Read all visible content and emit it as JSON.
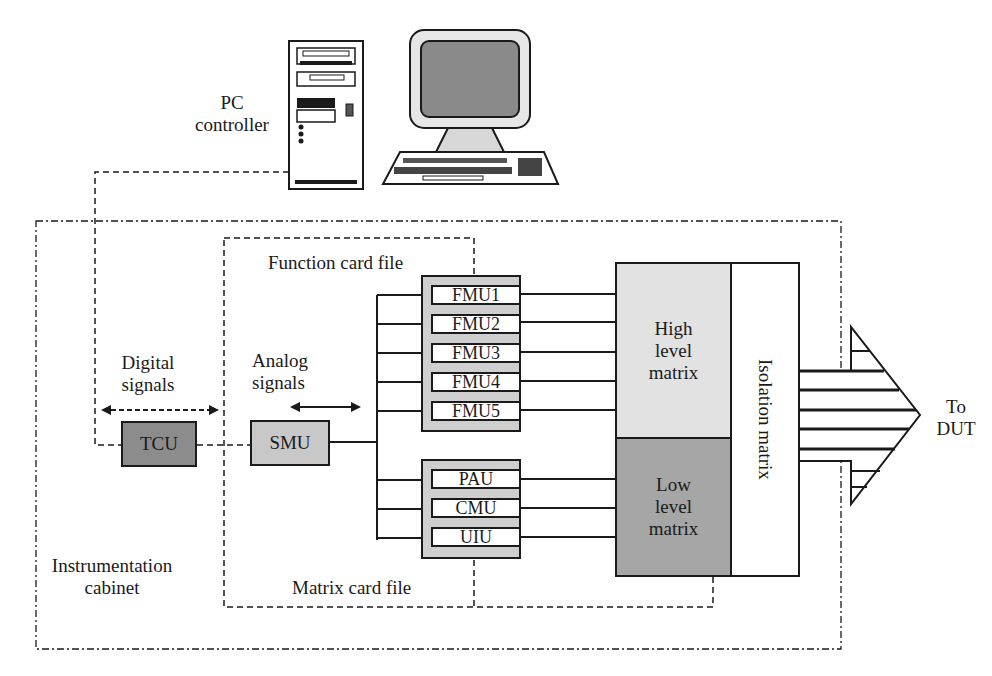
{
  "diagram": {
    "pc": {
      "label_line1": "PC",
      "label_line2": "controller"
    },
    "cabinet": {
      "label_line1": "Instrumentation",
      "label_line2": "cabinet"
    },
    "function_card_file": {
      "label": "Function card file",
      "units": [
        "FMU1",
        "FMU2",
        "FMU3",
        "FMU4",
        "FMU5"
      ]
    },
    "matrix_card_file": {
      "label": "Matrix card file",
      "units": [
        "PAU",
        "CMU",
        "UIU"
      ]
    },
    "tcu": {
      "label": "TCU"
    },
    "smu": {
      "label": "SMU"
    },
    "digital_signals": {
      "line1": "Digital",
      "line2": "signals"
    },
    "analog_signals": {
      "line1": "Analog",
      "line2": "signals"
    },
    "high_level_matrix": {
      "line1": "High",
      "line2": "level",
      "line3": "matrix"
    },
    "low_level_matrix": {
      "line1": "Low",
      "line2": "level",
      "line3": "matrix"
    },
    "isolation_matrix": {
      "label": "Isolation matrix"
    },
    "output": {
      "line1": "To",
      "line2": "DUT"
    },
    "colors": {
      "line": "#1a1a1a",
      "tcu_fill": "#8c8c8c",
      "smu_fill": "#c8c8c8",
      "card_file_fill": "#cfcfcf",
      "high_matrix_fill": "#e2e2e2",
      "low_matrix_fill": "#a6a6a6",
      "isolation_fill": "#ffffff"
    }
  }
}
